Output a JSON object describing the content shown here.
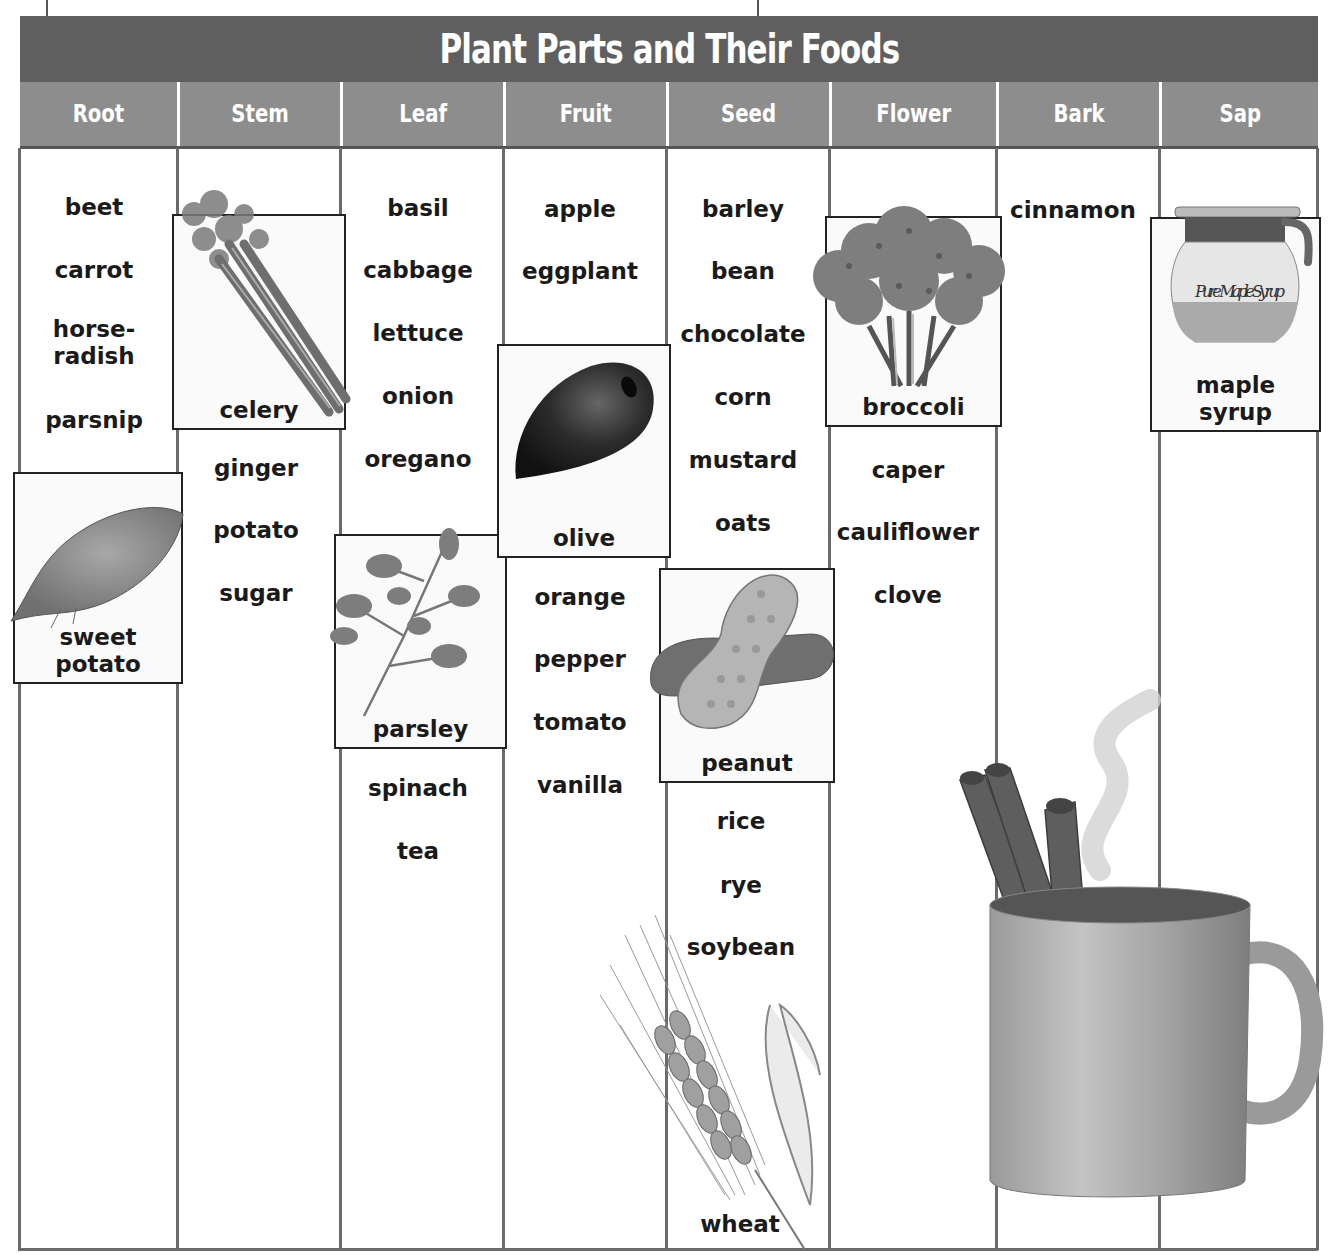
{
  "title": "Plant Parts and Their Foods",
  "columns": [
    {
      "header": "Root",
      "items": [
        "beet",
        "carrot",
        "horse-\nradish",
        "parsnip"
      ],
      "featured": "sweet potato"
    },
    {
      "header": "Stem",
      "items": [
        "ginger",
        "potato",
        "sugar"
      ],
      "featured": "celery"
    },
    {
      "header": "Leaf",
      "items": [
        "basil",
        "cabbage",
        "lettuce",
        "onion",
        "oregano",
        "spinach",
        "tea"
      ],
      "featured": "parsley"
    },
    {
      "header": "Fruit",
      "items": [
        "apple",
        "eggplant",
        "orange",
        "pepper",
        "tomato",
        "vanilla"
      ],
      "featured": "olive"
    },
    {
      "header": "Seed",
      "items": [
        "barley",
        "bean",
        "chocolate",
        "corn",
        "mustard",
        "oats",
        "rice",
        "rye",
        "soybean",
        "wheat"
      ],
      "featured": "peanut"
    },
    {
      "header": "Flower",
      "items": [
        "caper",
        "cauliflower",
        "clove"
      ],
      "featured": "broccoli"
    },
    {
      "header": "Bark",
      "items": [
        "cinnamon"
      ],
      "featured": null
    },
    {
      "header": "Sap",
      "items": [],
      "featured": "maple syrup"
    }
  ],
  "labels": {
    "beet": "beet",
    "carrot": "carrot",
    "horseradish_1": "horse-",
    "horseradish_2": "radish",
    "parsnip": "parsnip",
    "sweet_potato_1": "sweet",
    "sweet_potato_2": "potato",
    "celery": "celery",
    "ginger": "ginger",
    "potato": "potato",
    "sugar": "sugar",
    "basil": "basil",
    "cabbage": "cabbage",
    "lettuce": "lettuce",
    "onion": "onion",
    "oregano": "oregano",
    "parsley": "parsley",
    "spinach": "spinach",
    "tea": "tea",
    "apple": "apple",
    "eggplant": "eggplant",
    "olive": "olive",
    "orange": "orange",
    "pepper": "pepper",
    "tomato": "tomato",
    "vanilla": "vanilla",
    "barley": "barley",
    "bean": "bean",
    "chocolate": "chocolate",
    "corn": "corn",
    "mustard": "mustard",
    "oats": "oats",
    "peanut": "peanut",
    "rice": "rice",
    "rye": "rye",
    "soybean": "soybean",
    "wheat": "wheat",
    "broccoli": "broccoli",
    "caper": "caper",
    "cauliflower": "cauliflower",
    "clove": "clove",
    "cinnamon": "cinnamon",
    "maple_syrup_1": "maple",
    "maple_syrup_2": "syrup",
    "jar_label": "Pure Maple Syrup"
  },
  "colors": {
    "title_bg": "#5f5f5f",
    "header_bg": "#8d8d8d",
    "rule": "#6a6a6a"
  }
}
